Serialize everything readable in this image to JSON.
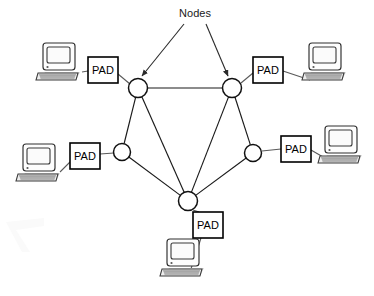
{
  "diagram": {
    "title_label": "Nodes",
    "type": "packet-switched-network-topology",
    "colors": {
      "background": "#ffffff",
      "line": "#1a1a1a",
      "node_stroke": "#111111",
      "box_stroke": "#000000",
      "text": "#000000"
    },
    "annotation": {
      "label": "Nodes",
      "x": 195,
      "y": 17,
      "arrows": [
        {
          "name": "arrow-to-top-left-node",
          "x1": 184,
          "y1": 24,
          "x2": 142,
          "y2": 76
        },
        {
          "name": "arrow-to-top-right-node",
          "x1": 206,
          "y1": 24,
          "x2": 228,
          "y2": 76
        }
      ]
    },
    "nodes": [
      {
        "id": "node-top-left",
        "label": "",
        "cx": 138,
        "cy": 88,
        "r": 9.5
      },
      {
        "id": "node-top-right",
        "label": "",
        "cx": 232,
        "cy": 88,
        "r": 9.5
      },
      {
        "id": "node-mid-left",
        "label": "",
        "cx": 122,
        "cy": 152,
        "r": 8.5
      },
      {
        "id": "node-mid-right",
        "label": "",
        "cx": 253,
        "cy": 153,
        "r": 8.5
      },
      {
        "id": "node-bottom",
        "label": "",
        "cx": 188,
        "cy": 201,
        "r": 9.5
      }
    ],
    "links": [
      {
        "from": "node-top-left",
        "to": "node-top-right"
      },
      {
        "from": "node-top-left",
        "to": "node-mid-left"
      },
      {
        "from": "node-top-left",
        "to": "node-bottom"
      },
      {
        "from": "node-top-right",
        "to": "node-mid-right"
      },
      {
        "from": "node-top-right",
        "to": "node-bottom"
      },
      {
        "from": "node-mid-left",
        "to": "node-bottom"
      },
      {
        "from": "node-mid-right",
        "to": "node-bottom"
      }
    ],
    "pads": [
      {
        "id": "pad-top-left",
        "label": "PAD",
        "x": 88,
        "y": 57,
        "w": 30,
        "h": 26
      },
      {
        "id": "pad-top-right",
        "label": "PAD",
        "x": 253,
        "y": 57,
        "w": 30,
        "h": 26
      },
      {
        "id": "pad-mid-left",
        "label": "PAD",
        "x": 70,
        "y": 143,
        "w": 30,
        "h": 26
      },
      {
        "id": "pad-mid-right",
        "label": "PAD",
        "x": 281,
        "y": 136,
        "w": 30,
        "h": 26
      },
      {
        "id": "pad-bottom",
        "label": "PAD",
        "x": 193,
        "y": 212,
        "w": 30,
        "h": 26
      }
    ],
    "terminals": [
      {
        "id": "terminal-top-left",
        "x": 36,
        "y": 42,
        "w": 48,
        "h": 41
      },
      {
        "id": "terminal-top-right",
        "x": 302,
        "y": 42,
        "w": 48,
        "h": 41
      },
      {
        "id": "terminal-mid-left",
        "x": 16,
        "y": 143,
        "w": 48,
        "h": 41
      },
      {
        "id": "terminal-mid-right",
        "x": 318,
        "y": 125,
        "w": 48,
        "h": 41
      },
      {
        "id": "terminal-bottom",
        "x": 160,
        "y": 238,
        "w": 48,
        "h": 41
      }
    ],
    "terminal_links": [
      {
        "from": "terminal-top-left",
        "to": "pad-top-left",
        "x1": 82,
        "y1": 72,
        "x2": 88,
        "y2": 71
      },
      {
        "from": "pad-top-left",
        "to": "node-top-left",
        "x1": 118,
        "y1": 74,
        "x2": 130,
        "y2": 84
      },
      {
        "from": "node-top-right",
        "to": "pad-top-right",
        "x1": 241,
        "y1": 83,
        "x2": 253,
        "y2": 73
      },
      {
        "from": "pad-top-right",
        "to": "terminal-top-right",
        "x1": 283,
        "y1": 71,
        "x2": 310,
        "y2": 80
      },
      {
        "from": "terminal-mid-left",
        "to": "pad-mid-left",
        "x1": 60,
        "y1": 172,
        "x2": 70,
        "y2": 162
      },
      {
        "from": "pad-mid-left",
        "to": "node-mid-left",
        "x1": 100,
        "y1": 154,
        "x2": 114,
        "y2": 153
      },
      {
        "from": "node-mid-right",
        "to": "pad-mid-right",
        "x1": 262,
        "y1": 151,
        "x2": 281,
        "y2": 149
      },
      {
        "from": "pad-mid-right",
        "to": "terminal-mid-right",
        "x1": 311,
        "y1": 150,
        "x2": 330,
        "y2": 161
      },
      {
        "from": "node-bottom",
        "to": "pad-bottom",
        "x1": 193,
        "y1": 210,
        "x2": 199,
        "y2": 212
      },
      {
        "from": "pad-bottom",
        "to": "terminal-bottom",
        "x1": 201,
        "y1": 238,
        "x2": 190,
        "y2": 272
      }
    ]
  }
}
